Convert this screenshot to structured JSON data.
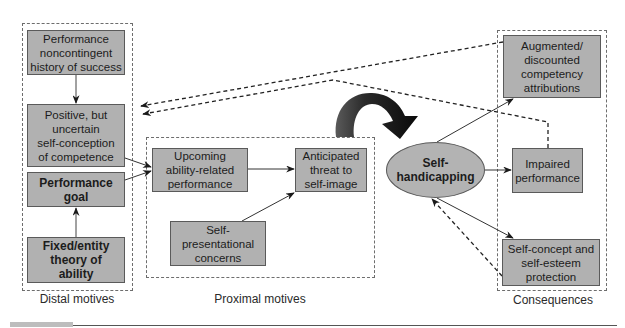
{
  "groups": {
    "distal": {
      "label": "Distal motives"
    },
    "proximal": {
      "label": "Proximal motives"
    },
    "consequences": {
      "label": "Consequences"
    }
  },
  "nodes": {
    "performance_history": {
      "label": "Performance\nnoncontingent\nhistory of success",
      "group": "distal"
    },
    "uncertain_self_conception": {
      "label": "Positive, but\nuncertain\nself-conception\nof competence",
      "group": "distal"
    },
    "performance_goal": {
      "label": "Performance\ngoal",
      "group": "distal",
      "bold": true
    },
    "entity_theory": {
      "label": "Fixed/entity\ntheory of\nability",
      "group": "distal",
      "bold": true
    },
    "upcoming_performance": {
      "label": "Upcoming\nability-related\nperformance",
      "group": "proximal"
    },
    "anticipated_threat": {
      "label": "Anticipated\nthreat to\nself-image",
      "group": "proximal"
    },
    "self_presentational": {
      "label": "Self-\npresentational\nconcerns",
      "group": "proximal"
    },
    "self_handicapping": {
      "label": "Self-\nhandicapping",
      "shape": "ellipse",
      "bold": true
    },
    "competency_attributions": {
      "label": "Augmented/\ndiscounted\ncompetency\nattributions",
      "group": "consequences"
    },
    "impaired_performance": {
      "label": "Impaired\nperformance",
      "group": "consequences"
    },
    "self_esteem_protection": {
      "label": "Self-concept and\nself-esteem\nprotection",
      "group": "consequences"
    }
  },
  "edges": [
    {
      "from": "performance_history",
      "to": "uncertain_self_conception",
      "style": "solid"
    },
    {
      "from": "entity_theory",
      "to": "performance_goal",
      "style": "solid"
    },
    {
      "from": "uncertain_self_conception",
      "to": "upcoming_performance",
      "style": "solid"
    },
    {
      "from": "performance_goal",
      "to": "upcoming_performance",
      "style": "solid"
    },
    {
      "from": "upcoming_performance",
      "to": "anticipated_threat",
      "style": "solid"
    },
    {
      "from": "self_presentational",
      "to": "anticipated_threat",
      "style": "solid"
    },
    {
      "from": "anticipated_threat",
      "to": "self_handicapping",
      "style": "bold-curved"
    },
    {
      "from": "self_handicapping",
      "to": "competency_attributions",
      "style": "solid"
    },
    {
      "from": "self_handicapping",
      "to": "impaired_performance",
      "style": "solid"
    },
    {
      "from": "self_handicapping",
      "to": "self_esteem_protection",
      "style": "solid"
    },
    {
      "from": "self_esteem_protection",
      "to": "self_handicapping",
      "style": "dashed"
    },
    {
      "from": "competency_attributions",
      "to": "uncertain_self_conception",
      "style": "dashed"
    },
    {
      "from": "impaired_performance",
      "to": "uncertain_self_conception",
      "style": "dashed"
    }
  ],
  "colors": {
    "node_fill": "#b1b1b1",
    "node_border": "#5a5a5a",
    "group_border": "#6d6d6d",
    "arrow": "#1a1a1a"
  }
}
